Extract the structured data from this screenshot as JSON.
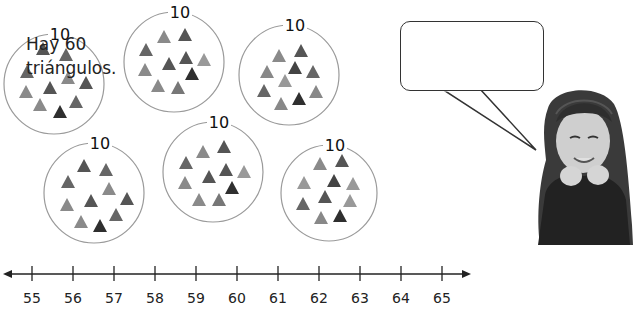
{
  "groups": [
    {
      "label": "10",
      "cx": 54,
      "cy": 84,
      "r": 50,
      "triangle_count": 10,
      "triangles": [
        [
          43,
          49,
          "#555"
        ],
        [
          66,
          55,
          "#666"
        ],
        [
          27,
          72,
          "#666"
        ],
        [
          68,
          78,
          "#8a8a8a"
        ],
        [
          86,
          83,
          "#555"
        ],
        [
          26,
          92,
          "#8a8a8a"
        ],
        [
          50,
          88,
          "#555"
        ],
        [
          40,
          105,
          "#8a8a8a"
        ],
        [
          76,
          102,
          "#666"
        ],
        [
          60,
          112,
          "#2f2f2f"
        ]
      ]
    },
    {
      "label": "10",
      "cx": 174,
      "cy": 62,
      "r": 50,
      "triangle_count": 10,
      "triangles": [
        [
          164,
          37,
          "#8a8a8a"
        ],
        [
          185,
          35,
          "#555"
        ],
        [
          146,
          50,
          "#666"
        ],
        [
          145,
          70,
          "#8a8a8a"
        ],
        [
          169,
          64,
          "#555"
        ],
        [
          186,
          58,
          "#555"
        ],
        [
          204,
          60,
          "#999"
        ],
        [
          192,
          74,
          "#2f2f2f"
        ],
        [
          158,
          86,
          "#8a8a8a"
        ],
        [
          178,
          88,
          "#777"
        ]
      ]
    },
    {
      "label": "10",
      "cx": 289,
      "cy": 75,
      "r": 50,
      "triangle_count": 10,
      "triangles": [
        [
          279,
          56,
          "#8a8a8a"
        ],
        [
          301,
          51,
          "#555"
        ],
        [
          267,
          72,
          "#888"
        ],
        [
          295,
          68,
          "#444"
        ],
        [
          313,
          72,
          "#666"
        ],
        [
          285,
          81,
          "#999"
        ],
        [
          264,
          91,
          "#666"
        ],
        [
          316,
          92,
          "#888"
        ],
        [
          281,
          104,
          "#888"
        ],
        [
          299,
          99,
          "#2f2f2f"
        ]
      ]
    },
    {
      "label": "10",
      "cx": 94,
      "cy": 193,
      "r": 50,
      "triangle_count": 10,
      "triangles": [
        [
          84,
          166,
          "#555"
        ],
        [
          106,
          170,
          "#666"
        ],
        [
          68,
          182,
          "#666"
        ],
        [
          109,
          189,
          "#8a8a8a"
        ],
        [
          127,
          199,
          "#555"
        ],
        [
          67,
          205,
          "#8a8a8a"
        ],
        [
          91,
          201,
          "#555"
        ],
        [
          81,
          222,
          "#8a8a8a"
        ],
        [
          116,
          215,
          "#666"
        ],
        [
          100,
          226,
          "#2f2f2f"
        ]
      ]
    },
    {
      "label": "10",
      "cx": 213,
      "cy": 172,
      "r": 50,
      "triangle_count": 10,
      "triangles": [
        [
          203,
          152,
          "#8a8a8a"
        ],
        [
          224,
          147,
          "#555"
        ],
        [
          186,
          163,
          "#666"
        ],
        [
          185,
          183,
          "#8a8a8a"
        ],
        [
          209,
          177,
          "#555"
        ],
        [
          226,
          170,
          "#555"
        ],
        [
          244,
          172,
          "#999"
        ],
        [
          232,
          188,
          "#2f2f2f"
        ],
        [
          199,
          200,
          "#8a8a8a"
        ],
        [
          219,
          200,
          "#777"
        ]
      ]
    },
    {
      "label": "10",
      "cx": 329,
      "cy": 193,
      "r": 48,
      "triangle_count": 10,
      "triangles": [
        [
          320,
          164,
          "#8a8a8a"
        ],
        [
          342,
          161,
          "#555"
        ],
        [
          304,
          183,
          "#999"
        ],
        [
          334,
          181,
          "#444"
        ],
        [
          353,
          184,
          "#999"
        ],
        [
          325,
          197,
          "#555"
        ],
        [
          303,
          204,
          "#666"
        ],
        [
          350,
          201,
          "#999"
        ],
        [
          321,
          218,
          "#888"
        ],
        [
          340,
          216,
          "#2f2f2f"
        ]
      ]
    }
  ],
  "speech_bubble": {
    "line1": "Hay 60",
    "line2": "triángulos."
  },
  "number_line": {
    "start": 55,
    "end": 65,
    "ticks": [
      "55",
      "56",
      "57",
      "58",
      "59",
      "60",
      "61",
      "62",
      "63",
      "64",
      "65"
    ],
    "arrows": "both"
  },
  "total_triangles": 60
}
